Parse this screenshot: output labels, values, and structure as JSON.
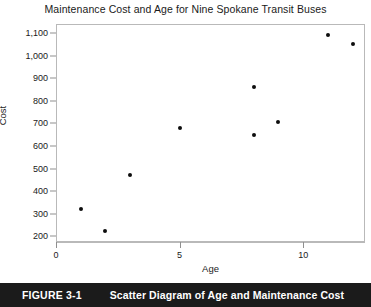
{
  "chart_data": {
    "type": "scatter",
    "title": "Maintenance Cost and Age for Nine Spokane Transit Buses",
    "xlabel": "Age",
    "ylabel": "Cost",
    "xlim": [
      0,
      12.5
    ],
    "ylim": [
      175,
      1140
    ],
    "grid": false,
    "legend": null,
    "x_ticks": [
      {
        "value": 0,
        "label": "0"
      },
      {
        "value": 5,
        "label": "5"
      },
      {
        "value": 10,
        "label": "10"
      }
    ],
    "y_ticks": [
      {
        "value": 200,
        "label": "200"
      },
      {
        "value": 300,
        "label": "300"
      },
      {
        "value": 400,
        "label": "400"
      },
      {
        "value": 500,
        "label": "500"
      },
      {
        "value": 600,
        "label": "600"
      },
      {
        "value": 700,
        "label": "700"
      },
      {
        "value": 800,
        "label": "800"
      },
      {
        "value": 900,
        "label": "900"
      },
      {
        "value": 1000,
        "label": "1,000"
      },
      {
        "value": 1100,
        "label": "1,100"
      }
    ],
    "points": [
      {
        "x": 1,
        "y": 320
      },
      {
        "x": 2,
        "y": 225
      },
      {
        "x": 3,
        "y": 470
      },
      {
        "x": 5,
        "y": 680
      },
      {
        "x": 8,
        "y": 650
      },
      {
        "x": 8,
        "y": 860
      },
      {
        "x": 9,
        "y": 705
      },
      {
        "x": 11,
        "y": 1090
      },
      {
        "x": 12,
        "y": 1050
      }
    ],
    "marker_color": "#0d0d0d",
    "frame_color": "#b9b9b9"
  },
  "caption": {
    "number": "FIGURE 3-1",
    "text": "Scatter Diagram of Age and Maintenance Cost",
    "background_color": "#1b1b1b",
    "text_color": "#ffffff"
  }
}
